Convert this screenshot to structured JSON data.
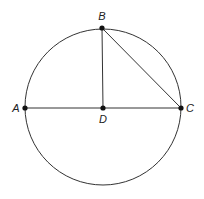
{
  "diagram": {
    "type": "geometry",
    "colors": {
      "stroke": "#333333",
      "point": "#111111",
      "background": "#ffffff"
    },
    "circle": {
      "cx": 103,
      "cy": 107,
      "r": 78
    },
    "points": [
      {
        "id": "A",
        "label": "A",
        "x": 25,
        "y": 108,
        "lx": 16,
        "ly": 112
      },
      {
        "id": "B",
        "label": "B",
        "x": 102,
        "y": 28,
        "lx": 102,
        "ly": 20
      },
      {
        "id": "C",
        "label": "C",
        "x": 181,
        "y": 108,
        "lx": 190,
        "ly": 112
      },
      {
        "id": "D",
        "label": "D",
        "x": 103,
        "y": 108,
        "lx": 103,
        "ly": 123
      }
    ],
    "segments": [
      {
        "from": "A",
        "to": "C"
      },
      {
        "from": "B",
        "to": "D"
      },
      {
        "from": "B",
        "to": "C"
      }
    ]
  }
}
